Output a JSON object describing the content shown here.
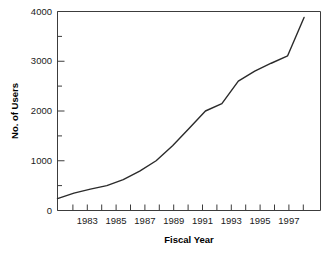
{
  "chart_data": {
    "type": "line",
    "title": "",
    "xlabel": "Fiscal Year",
    "ylabel": "No. of Users",
    "xlim": [
      1982,
      1998
    ],
    "ylim": [
      0,
      4000
    ],
    "grid": false,
    "legend": false,
    "x": [
      1982,
      1983,
      1984,
      1985,
      1986,
      1987,
      1988,
      1989,
      1990,
      1991,
      1992,
      1993,
      1994,
      1995,
      1996,
      1997
    ],
    "values": [
      240,
      350,
      430,
      500,
      620,
      790,
      1000,
      1300,
      1650,
      2000,
      2150,
      2600,
      2800,
      2960,
      3110,
      3880
    ],
    "series": [
      {
        "name": "No. of Users",
        "color": "#2b2b2b",
        "values": [
          240,
          350,
          430,
          500,
          620,
          790,
          1000,
          1300,
          1650,
          2000,
          2150,
          2600,
          2800,
          2960,
          3110,
          3880
        ]
      }
    ],
    "x_tick_values": [
      1982,
      1983,
      1984,
      1985,
      1986,
      1987,
      1988,
      1989,
      1990,
      1991,
      1992,
      1993,
      1994,
      1995,
      1996,
      1997,
      1998
    ],
    "x_tick_labels": [
      "1983",
      "1985",
      "1987",
      "1989",
      "1991",
      "1993",
      "1995",
      "1997"
    ],
    "x_labeled_values": [
      1983,
      1985,
      1987,
      1989,
      1991,
      1993,
      1995,
      1997
    ],
    "y_major_ticks": [
      0,
      1000,
      2000,
      3000,
      4000
    ],
    "y_major_labels": [
      "0",
      "1000",
      "2000",
      "3000",
      "4000"
    ],
    "y_minor_ticks": [
      500,
      1500,
      2500,
      3500
    ]
  },
  "axes": {
    "y_title": "No. of Users",
    "x_title": "Fiscal Year"
  },
  "y_labels": {
    "t0": "0",
    "t1": "1000",
    "t2": "2000",
    "t3": "3000",
    "t4": "4000"
  },
  "x_labels": {
    "t0": "1983",
    "t1": "1985",
    "t2": "1987",
    "t3": "1989",
    "t4": "1991",
    "t5": "1993",
    "t6": "1995",
    "t7": "1997"
  }
}
